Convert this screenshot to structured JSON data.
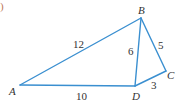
{
  "part_marker": ")",
  "figure": {
    "vertices": {
      "A": "A",
      "B": "B",
      "C": "C",
      "D": "D"
    },
    "edges": [
      {
        "from": "A",
        "to": "B",
        "length": "12"
      },
      {
        "from": "B",
        "to": "D",
        "length": "6"
      },
      {
        "from": "B",
        "to": "C",
        "length": "5"
      },
      {
        "from": "A",
        "to": "D",
        "length": "10"
      },
      {
        "from": "D",
        "to": "C",
        "length": "3"
      }
    ],
    "line_color": "#3a8fd0"
  }
}
